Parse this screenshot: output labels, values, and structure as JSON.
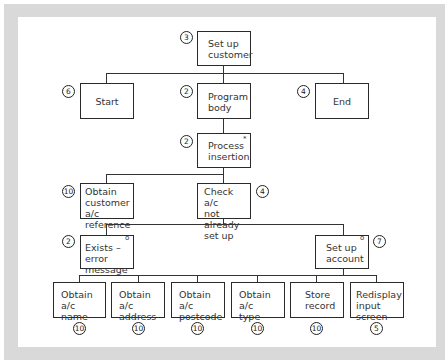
{
  "diagram": {
    "type": "structure-chart",
    "nodes": {
      "root": {
        "label": "Set up\ncustomer",
        "score": "3",
        "marker": ""
      },
      "start": {
        "label": "Start",
        "score": "6",
        "marker": ""
      },
      "body": {
        "label": "Program\nbody",
        "score": "2",
        "marker": ""
      },
      "end": {
        "label": "End",
        "score": "4",
        "marker": ""
      },
      "process": {
        "label": "Process\ninsertion",
        "score": "2",
        "marker": "*"
      },
      "obtain_ref": {
        "label": "Obtain\ncustomer a/c\nreference",
        "score": "10",
        "marker": ""
      },
      "check": {
        "label": "Check a/c\nnot already\nset up",
        "score": "4",
        "marker": ""
      },
      "exists": {
        "label": "Exists – error\nmessage",
        "score": "2",
        "marker": "o"
      },
      "setup_acct": {
        "label": "Set up\naccount",
        "score": "7",
        "marker": "o"
      },
      "name": {
        "label": "Obtain a/c\nname",
        "score": "10",
        "marker": ""
      },
      "address": {
        "label": "Obtain a/c\naddress",
        "score": "10",
        "marker": ""
      },
      "postcode": {
        "label": "Obtain a/c\npostcode",
        "score": "10",
        "marker": ""
      },
      "acct_type": {
        "label": "Obtain a/c\ntype",
        "score": "10",
        "marker": ""
      },
      "store": {
        "label": "Store\nrecord",
        "score": "10",
        "marker": ""
      },
      "redisplay": {
        "label": "Redisplay\ninput screen",
        "score": "5",
        "marker": ""
      }
    },
    "edges": [
      [
        "root",
        "start"
      ],
      [
        "root",
        "body"
      ],
      [
        "root",
        "end"
      ],
      [
        "body",
        "process"
      ],
      [
        "process",
        "obtain_ref"
      ],
      [
        "process",
        "check"
      ],
      [
        "check",
        "exists"
      ],
      [
        "check",
        "setup_acct"
      ],
      [
        "setup_acct",
        "name"
      ],
      [
        "setup_acct",
        "address"
      ],
      [
        "setup_acct",
        "postcode"
      ],
      [
        "setup_acct",
        "acct_type"
      ],
      [
        "setup_acct",
        "store"
      ],
      [
        "setup_acct",
        "redisplay"
      ]
    ]
  }
}
